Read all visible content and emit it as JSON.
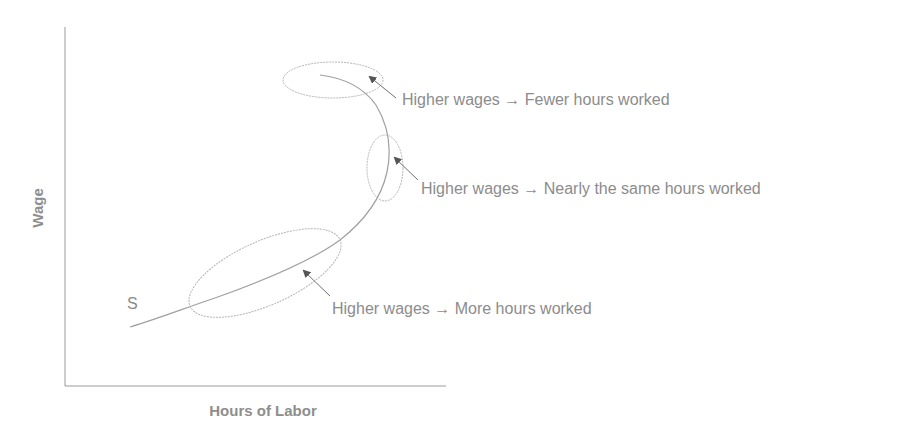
{
  "diagram": {
    "y_axis_label": "Wage",
    "x_axis_label": "Hours of Labor",
    "curve_label": "S",
    "annotations": [
      {
        "id": "fewer",
        "text": "Higher wages → Fewer hours worked"
      },
      {
        "id": "same",
        "text": "Higher wages → Nearly the same hours worked"
      },
      {
        "id": "more",
        "text": "Higher wages → More hours worked"
      }
    ],
    "colors": {
      "axis": "#9a9a9a",
      "curve": "#a0a0a0",
      "ellipse": "#b4b4b4",
      "arrow": "#555555",
      "text": "#8c8c8c"
    }
  }
}
